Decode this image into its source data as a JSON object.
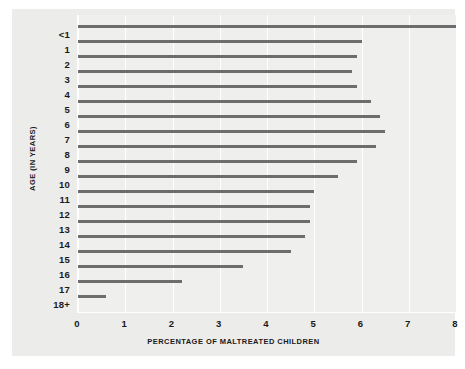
{
  "chart_data": {
    "type": "bar",
    "orientation": "horizontal",
    "title": "",
    "xlabel": "PERCENTAGE OF MALTREATED CHILDREN",
    "ylabel": "AGE (IN YEARS)",
    "xlim": [
      0,
      8
    ],
    "ylim_categories": 19,
    "grid": "vertical",
    "legend": "none",
    "bar_color": "#6d6d6d",
    "plot_background": "#efefee",
    "panel_background": "#ececeb",
    "xticks": [
      "0",
      "1",
      "2",
      "3",
      "4",
      "5",
      "6",
      "7",
      "8"
    ],
    "xtick_values": [
      0,
      1,
      2,
      3,
      4,
      5,
      6,
      7,
      8
    ],
    "categories": [
      "<1",
      "1",
      "2",
      "3",
      "4",
      "5",
      "6",
      "7",
      "8",
      "9",
      "10",
      "11",
      "12",
      "13",
      "14",
      "15",
      "16",
      "17",
      "18+"
    ],
    "values": [
      8.0,
      6.0,
      5.9,
      5.8,
      5.9,
      6.2,
      6.4,
      6.5,
      6.3,
      5.9,
      5.5,
      5.0,
      4.9,
      4.9,
      4.8,
      4.5,
      3.5,
      2.2,
      0.6
    ],
    "series": [
      {
        "name": "Percentage of maltreated children",
        "values": [
          8.0,
          6.0,
          5.9,
          5.8,
          5.9,
          6.2,
          6.4,
          6.5,
          6.3,
          5.9,
          5.5,
          5.0,
          4.9,
          4.9,
          4.8,
          4.5,
          3.5,
          2.2,
          0.6
        ]
      }
    ]
  }
}
